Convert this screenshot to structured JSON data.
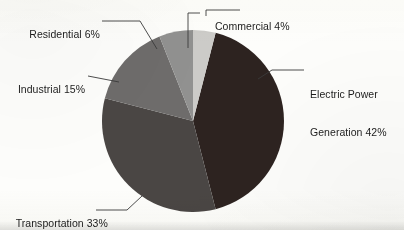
{
  "chart_data": {
    "type": "pie",
    "title": "",
    "subtitle": "",
    "xlabel": "",
    "ylabel": "",
    "legend_position": "none",
    "grid": false,
    "units": "percent",
    "labels": [
      "Commercial",
      "Electric Power Generation",
      "Transportation",
      "Industrial",
      "Residential"
    ],
    "values": [
      4,
      42,
      33,
      15,
      6
    ],
    "start_angle_deg": 0,
    "direction": "clockwise",
    "slices": [
      {
        "name": "Commercial",
        "value": 4,
        "label_text": "Commercial 4%",
        "color": "#cccbc8",
        "start_deg": 0,
        "end_deg": 14.4
      },
      {
        "name": "Electric Power Generation",
        "value": 42,
        "label_line1": "Electric Power",
        "label_line2": "Generation 42%",
        "label_text": "Electric Power Generation 42%",
        "color": "#2d2320",
        "start_deg": 14.4,
        "end_deg": 165.6
      },
      {
        "name": "Transportation",
        "value": 33,
        "label_text": "Transportation 33%",
        "color": "#4a4644",
        "start_deg": 165.6,
        "end_deg": 284.4
      },
      {
        "name": "Industrial",
        "value": 15,
        "label_text": "Industrial 15%",
        "color": "#6e6c6b",
        "start_deg": 284.4,
        "end_deg": 338.4
      },
      {
        "name": "Residential",
        "value": 6,
        "label_text": "Residential 6%",
        "color": "#919190",
        "start_deg": 338.4,
        "end_deg": 360
      }
    ],
    "geometry": {
      "center_x": 193,
      "center_y": 121,
      "radius": 91
    },
    "colors": {
      "background": "#fdfdfb",
      "text": "#1d1d1d",
      "leader_line": "#3a3a3a"
    }
  }
}
